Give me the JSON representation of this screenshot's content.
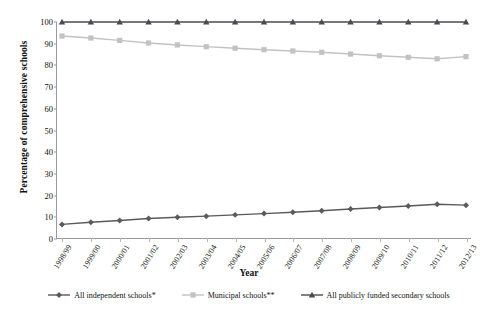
{
  "figure": {
    "cut_off_title": "",
    "xlabel": "Year",
    "ylabel": "Percentage of comprehensive schools"
  },
  "chart_data": {
    "type": "line",
    "title": "",
    "xlabel": "Year",
    "ylabel": "Percentage of comprehensive schools",
    "ylim": [
      0,
      100
    ],
    "yticks": [
      0,
      10,
      20,
      30,
      40,
      50,
      60,
      70,
      80,
      90,
      100
    ],
    "grid": false,
    "legend_position": "bottom",
    "categories": [
      "1998/99",
      "1999/00",
      "2000/01",
      "2001/02",
      "2002/03",
      "2003/04",
      "2004/05",
      "2005/06",
      "2006/07",
      "2007/08",
      "2008/09",
      "2009/10",
      "2010/11",
      "2011/12",
      "2012/13"
    ],
    "series": [
      {
        "name": "All independent schools*",
        "marker": "diamond",
        "color": "#5a5a5a",
        "values": [
          6.5,
          7.5,
          8.3,
          9.2,
          9.8,
          10.3,
          10.9,
          11.5,
          12.1,
          12.8,
          13.6,
          14.3,
          15.0,
          15.8,
          15.4
        ]
      },
      {
        "name": "Municipal schools**",
        "marker": "square",
        "color": "#c2c2c2",
        "values": [
          93.5,
          92.6,
          91.5,
          90.3,
          89.4,
          88.6,
          87.9,
          87.2,
          86.6,
          86.0,
          85.2,
          84.4,
          83.7,
          83.0,
          84.0
        ]
      },
      {
        "name": "All publicly funded secondary schools",
        "marker": "triangle",
        "color": "#4a4a52",
        "values": [
          100,
          100,
          100,
          100,
          100,
          100,
          100,
          100,
          100,
          100,
          100,
          100,
          100,
          100,
          100
        ]
      }
    ]
  },
  "legend": [
    {
      "label": "All independent schools*",
      "color": "#5a5a5a",
      "marker": "diamond"
    },
    {
      "label": "Municipal schools**",
      "color": "#c2c2c2",
      "marker": "square"
    },
    {
      "label": "All publicly funded secondary schools",
      "color": "#4a4a52",
      "marker": "triangle"
    }
  ]
}
